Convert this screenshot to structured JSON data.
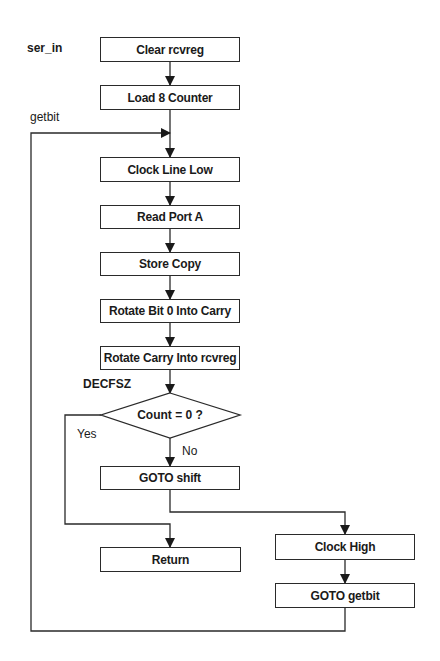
{
  "labels": {
    "entry": "ser_in",
    "loop": "getbit",
    "decision_instr": "DECFSZ",
    "yes": "Yes",
    "no": "No"
  },
  "boxes": [
    {
      "id": "clear",
      "text": "Clear rcvreg"
    },
    {
      "id": "load",
      "text": "Load 8 Counter"
    },
    {
      "id": "clk_low",
      "text": "Clock Line Low"
    },
    {
      "id": "read",
      "text": "Read Port A"
    },
    {
      "id": "store",
      "text": "Store Copy"
    },
    {
      "id": "rot_bit",
      "text": "Rotate Bit 0 Into Carry"
    },
    {
      "id": "rot_carry",
      "text": "Rotate Carry Into rcvreg"
    },
    {
      "id": "goto_shift",
      "text": "GOTO shift"
    },
    {
      "id": "ret",
      "text": "Return"
    },
    {
      "id": "clk_high",
      "text": "Clock High"
    },
    {
      "id": "goto_getbit",
      "text": "GOTO getbit"
    }
  ],
  "decision": {
    "text": "Count = 0 ?"
  }
}
